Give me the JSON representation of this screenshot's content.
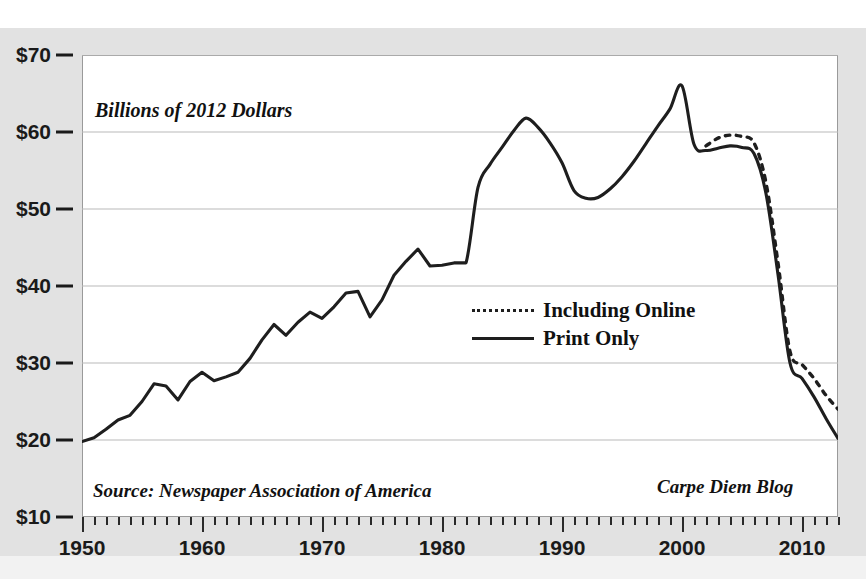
{
  "chart_data": {
    "type": "line",
    "title": "",
    "ylabel": "Billions of 2012 Dollars",
    "xlabel": "",
    "ylim": [
      10,
      70
    ],
    "xlim": [
      1950,
      2013
    ],
    "grid": true,
    "yticks": [
      "$10",
      "$20",
      "$30",
      "$40",
      "$50",
      "$60",
      "$70"
    ],
    "ytick_values": [
      10,
      20,
      30,
      40,
      50,
      60,
      70
    ],
    "xticks": [
      "1950",
      "1960",
      "1970",
      "1980",
      "1990",
      "2000",
      "2010"
    ],
    "xtick_values": [
      1950,
      1960,
      1970,
      1980,
      1990,
      2000,
      2010
    ],
    "legend_position": "center-right",
    "series": [
      {
        "name": "Print Only",
        "style": "solid",
        "color": "#1e1e1e",
        "x": [
          1950,
          1951,
          1952,
          1953,
          1954,
          1955,
          1956,
          1957,
          1958,
          1959,
          1960,
          1961,
          1962,
          1963,
          1964,
          1965,
          1966,
          1967,
          1968,
          1969,
          1970,
          1971,
          1972,
          1973,
          1974,
          1975,
          1976,
          1977,
          1978,
          1979,
          1980,
          1981,
          1982,
          1983,
          1984,
          1985,
          1986,
          1987,
          1988,
          1989,
          1990,
          1991,
          1992,
          1993,
          1994,
          1995,
          1996,
          1997,
          1998,
          1999,
          2000,
          2001,
          2002,
          2003,
          2004,
          2005,
          2006,
          2007,
          2008,
          2009,
          2010,
          2011,
          2012,
          2013
        ],
        "values": [
          19.8,
          20.3,
          21.4,
          22.6,
          23.2,
          25.0,
          27.3,
          27.0,
          25.2,
          27.6,
          28.8,
          27.7,
          28.2,
          28.8,
          30.6,
          33.0,
          35.0,
          33.6,
          35.3,
          36.6,
          35.8,
          37.3,
          39.1,
          39.3,
          36.0,
          38.2,
          41.4,
          43.2,
          44.8,
          42.6,
          42.7,
          43.0,
          43.0,
          52.8,
          55.8,
          58.0,
          60.2,
          61.8,
          60.6,
          58.6,
          56.0,
          52.4,
          51.4,
          51.5,
          52.6,
          54.2,
          56.2,
          58.5,
          60.8,
          63.0,
          66.0,
          58.4,
          57.6,
          57.9,
          58.2,
          58.0,
          57.2,
          52.0,
          41.5,
          30.0,
          28.0,
          25.6,
          22.8,
          20.2
        ]
      },
      {
        "name": "Including Online",
        "style": "dashed",
        "color": "#1e1e1e",
        "x": [
          2002,
          2003,
          2004,
          2005,
          2006,
          2007,
          2008,
          2009,
          2010,
          2011,
          2012,
          2013
        ],
        "values": [
          58.2,
          59.2,
          59.6,
          59.4,
          58.6,
          53.4,
          43.0,
          31.5,
          29.8,
          28.0,
          25.8,
          24.0
        ]
      }
    ],
    "annotations": [
      {
        "name": "y-axis-title",
        "text": "Billions of 2012 Dollars"
      },
      {
        "name": "source-note",
        "text": "Source: Newspaper Association of America"
      },
      {
        "name": "blog-note",
        "text": "Carpe Diem Blog"
      }
    ]
  },
  "axis": {
    "y_title": "Billions of 2012 Dollars",
    "y_labels": [
      "$70",
      "$60",
      "$50",
      "$40",
      "$30",
      "$20",
      "$10"
    ],
    "x_labels": [
      "1950",
      "1960",
      "1970",
      "1980",
      "1990",
      "2000",
      "2010"
    ]
  },
  "legend": {
    "items": [
      {
        "label": "Including Online",
        "style": "dashed"
      },
      {
        "label": "Print Only",
        "style": "solid"
      }
    ]
  },
  "notes": {
    "source": "Source: Newspaper Association of America",
    "blog": "Carpe Diem Blog"
  },
  "colors": {
    "line": "#1e1e1e",
    "grid": "#b9b9b9",
    "page": "#e2e2e2",
    "plot_bg": "#ffffff"
  }
}
